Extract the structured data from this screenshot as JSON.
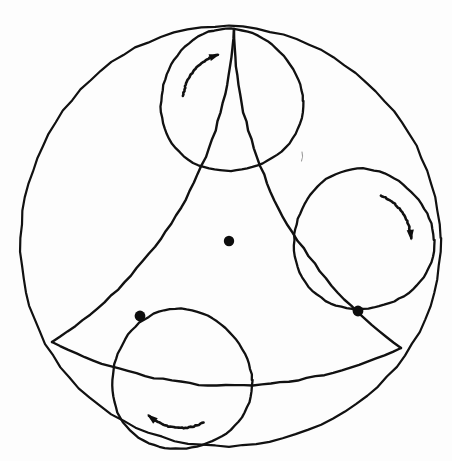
{
  "figure": {
    "background_color": "#fdfdfd",
    "ink_color": "#111111",
    "dot_color": "#0d0d0d",
    "canvas": {
      "width": 452,
      "height": 461
    }
  },
  "outer_circle": {
    "label": "outer boundary circle",
    "cx": 229,
    "cy": 238,
    "r": 210,
    "stroke_width": 2.2
  },
  "center_point": {
    "label": "center point",
    "cx": 229,
    "cy": 241,
    "r": 5.2
  },
  "curved_triangle": {
    "label": "curved triangle (Reuleaux-like arcs)",
    "stroke_width": 2.4,
    "vertices": [
      {
        "name": "apex-top",
        "x": 234,
        "y": 29
      },
      {
        "name": "vertex-bottom-left",
        "x": 52,
        "y": 342
      },
      {
        "name": "vertex-bottom-right",
        "x": 401,
        "y": 348
      }
    ],
    "arcs": [
      {
        "name": "arc-left",
        "from": "apex-top",
        "to": "vertex-bottom-left",
        "radius": 396,
        "sweep": 1
      },
      {
        "name": "arc-right",
        "from": "apex-top",
        "to": "vertex-bottom-right",
        "radius": 396,
        "sweep": 0
      },
      {
        "name": "arc-bottom",
        "from": "vertex-bottom-left",
        "to": "vertex-bottom-right",
        "radius": 396,
        "sweep": 0
      }
    ]
  },
  "rolling_circles": [
    {
      "name": "rolling-circle-top",
      "cx": 231,
      "cy": 101,
      "r": 71,
      "stroke_width": 2.3,
      "rotation": "clockwise",
      "arrow": {
        "name": "rotation-arrow-top",
        "cx": 231,
        "cy": 101,
        "r": 48,
        "start_angle_deg": 186,
        "end_angle_deg": 254,
        "direction": "clockwise"
      }
    },
    {
      "name": "rolling-circle-right",
      "cx": 363,
      "cy": 240,
      "r": 70,
      "stroke_width": 2.3,
      "rotation": "clockwise",
      "arrow": {
        "name": "rotation-arrow-right",
        "cx": 363,
        "cy": 240,
        "r": 48,
        "start_angle_deg": 292,
        "end_angle_deg": 358,
        "direction": "clockwise"
      }
    },
    {
      "name": "rolling-circle-bottom",
      "cx": 181,
      "cy": 380,
      "r": 70,
      "stroke_width": 2.3,
      "rotation": "clockwise",
      "arrow": {
        "name": "rotation-arrow-bottom",
        "cx": 181,
        "cy": 380,
        "r": 48,
        "start_angle_deg": 62,
        "end_angle_deg": 132,
        "direction": "clockwise"
      }
    }
  ],
  "contact_dots": [
    {
      "name": "contact-dot-left",
      "cx": 140,
      "cy": 316,
      "r": 5.4
    },
    {
      "name": "contact-dot-right",
      "cx": 358,
      "cy": 311,
      "r": 5.4
    }
  ],
  "stray_mark": {
    "name": "stray-pen-mark",
    "x": 302,
    "y": 152,
    "length": 9
  }
}
